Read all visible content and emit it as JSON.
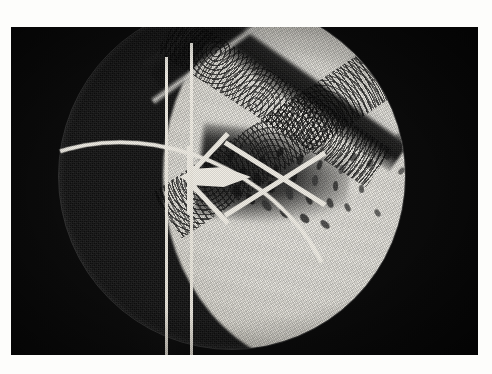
{
  "page": {
    "background_color": "#fdfdfb",
    "width": 492,
    "height": 374
  },
  "photo": {
    "alt_text": "Schlieren photograph of supersonic flow past a lens-shaped model",
    "frame": {
      "left": 11,
      "top": 27,
      "width": 467,
      "height": 328
    },
    "print_color": "#0a0a0a",
    "highlight_color": "#efece4"
  },
  "scene": {
    "title": "Schlieren photograph",
    "subject": "supersonic flow over a biconvex lens model",
    "aperture": {
      "name": "circular test-section window",
      "center_x": 221,
      "center_y": 149,
      "radius": 173
    },
    "features": [
      {
        "name": "bow-shock-upper",
        "label": "upper oblique shock wave",
        "angle_deg": 35
      },
      {
        "name": "bow-shock-lower",
        "label": "lower oblique shock wave",
        "angle_deg": -36
      },
      {
        "name": "model",
        "label": "lens-shaped airfoil model"
      },
      {
        "name": "support-struts",
        "label": "model support struts"
      },
      {
        "name": "reference-wire-1",
        "label": "vertical reference wire"
      },
      {
        "name": "reference-wire-2",
        "label": "vertical reference wire"
      },
      {
        "name": "turbulent-wake",
        "label": "turbulent wake with vortices"
      },
      {
        "name": "lower-arc",
        "label": "bright curved window edge"
      }
    ]
  },
  "wake": {
    "eddies": [
      {
        "x": 8,
        "y": 40,
        "w": 7,
        "h": 13,
        "r": -18,
        "pale": false
      },
      {
        "x": 14,
        "y": 56,
        "w": 6,
        "h": 11,
        "r": -12,
        "pale": true
      },
      {
        "x": 19,
        "y": 27,
        "w": 6,
        "h": 12,
        "r": 22,
        "pale": false
      },
      {
        "x": 24,
        "y": 62,
        "w": 8,
        "h": 12,
        "r": -28,
        "pale": false
      },
      {
        "x": 30,
        "y": 44,
        "w": 7,
        "h": 15,
        "r": 8,
        "pale": false
      },
      {
        "x": 34,
        "y": 20,
        "w": 6,
        "h": 11,
        "r": 30,
        "pale": true
      },
      {
        "x": 38,
        "y": 70,
        "w": 7,
        "h": 12,
        "r": -34,
        "pale": false
      },
      {
        "x": 44,
        "y": 50,
        "w": 8,
        "h": 14,
        "r": -5,
        "pale": false
      },
      {
        "x": 49,
        "y": 33,
        "w": 6,
        "h": 12,
        "r": 18,
        "pale": false
      },
      {
        "x": 54,
        "y": 76,
        "w": 7,
        "h": 13,
        "r": -40,
        "pale": true
      },
      {
        "x": 58,
        "y": 58,
        "w": 8,
        "h": 12,
        "r": -10,
        "pale": false
      },
      {
        "x": 63,
        "y": 41,
        "w": 6,
        "h": 14,
        "r": 12,
        "pale": false
      },
      {
        "x": 68,
        "y": 24,
        "w": 6,
        "h": 10,
        "r": 26,
        "pale": false
      },
      {
        "x": 72,
        "y": 84,
        "w": 7,
        "h": 12,
        "r": -44,
        "pale": false
      },
      {
        "x": 77,
        "y": 64,
        "w": 7,
        "h": 13,
        "r": -16,
        "pale": true
      },
      {
        "x": 82,
        "y": 47,
        "w": 6,
        "h": 12,
        "r": 6,
        "pale": false
      },
      {
        "x": 88,
        "y": 31,
        "w": 6,
        "h": 11,
        "r": 20,
        "pale": false
      },
      {
        "x": 92,
        "y": 90,
        "w": 7,
        "h": 11,
        "r": -48,
        "pale": false
      },
      {
        "x": 97,
        "y": 70,
        "w": 6,
        "h": 12,
        "r": -20,
        "pale": false
      },
      {
        "x": 103,
        "y": 52,
        "w": 6,
        "h": 11,
        "r": 2,
        "pale": true
      },
      {
        "x": 108,
        "y": 37,
        "w": 5,
        "h": 10,
        "r": 16,
        "pale": false
      },
      {
        "x": 113,
        "y": 96,
        "w": 6,
        "h": 11,
        "r": -50,
        "pale": false
      },
      {
        "x": 118,
        "y": 75,
        "w": 6,
        "h": 10,
        "r": -24,
        "pale": false
      },
      {
        "x": 124,
        "y": 58,
        "w": 5,
        "h": 10,
        "r": -2,
        "pale": false
      },
      {
        "x": 130,
        "y": 42,
        "w": 5,
        "h": 9,
        "r": 14,
        "pale": true
      },
      {
        "x": 136,
        "y": 80,
        "w": 5,
        "h": 9,
        "r": -30,
        "pale": false
      },
      {
        "x": 142,
        "y": 30,
        "w": 5,
        "h": 9,
        "r": 24,
        "pale": false
      },
      {
        "x": 150,
        "y": 62,
        "w": 5,
        "h": 8,
        "r": -8,
        "pale": false
      },
      {
        "x": 158,
        "y": 36,
        "w": 6,
        "h": 9,
        "r": 30,
        "pale": false
      },
      {
        "x": 166,
        "y": 86,
        "w": 5,
        "h": 8,
        "r": -36,
        "pale": false
      },
      {
        "x": 176,
        "y": 28,
        "w": 6,
        "h": 9,
        "r": 34,
        "pale": false
      },
      {
        "x": 190,
        "y": 44,
        "w": 5,
        "h": 8,
        "r": 40,
        "pale": false
      },
      {
        "x": 202,
        "y": 100,
        "w": 5,
        "h": 8,
        "r": -42,
        "pale": false
      },
      {
        "x": 214,
        "y": 58,
        "w": 4,
        "h": 7,
        "r": 46,
        "pale": false
      }
    ]
  }
}
